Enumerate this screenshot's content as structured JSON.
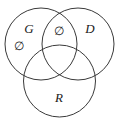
{
  "figure": {
    "name": "three-set-venn-diagram",
    "background_color": "#ffffff",
    "stroke_color": "#3a3a3a",
    "text_color": "#1a1a1a",
    "width": 119,
    "height": 123
  },
  "sets": [
    {
      "id": "G",
      "label": "G",
      "name": "set-circle-g",
      "position": "top-left",
      "cx": 41,
      "cy": 44,
      "r": 36
    },
    {
      "id": "D",
      "label": "D",
      "name": "set-circle-d",
      "position": "top-right",
      "cx": 78,
      "cy": 44,
      "r": 36
    },
    {
      "id": "R",
      "label": "R",
      "name": "set-circle-r",
      "position": "bottom-center",
      "cx": 59.5,
      "cy": 81,
      "r": 36
    }
  ],
  "set_labels": [
    {
      "text": "G",
      "x": 29,
      "y": 30
    },
    {
      "text": "D",
      "x": 90,
      "y": 30
    },
    {
      "text": "R",
      "x": 59,
      "y": 99
    }
  ],
  "region_annotations": [
    {
      "symbol": "∅",
      "meaning": "empty-set",
      "region": "G-only",
      "x": 19,
      "y": 47
    },
    {
      "symbol": "∅",
      "meaning": "empty-set",
      "region": "G-intersect-D-only",
      "x": 59,
      "y": 32
    }
  ]
}
